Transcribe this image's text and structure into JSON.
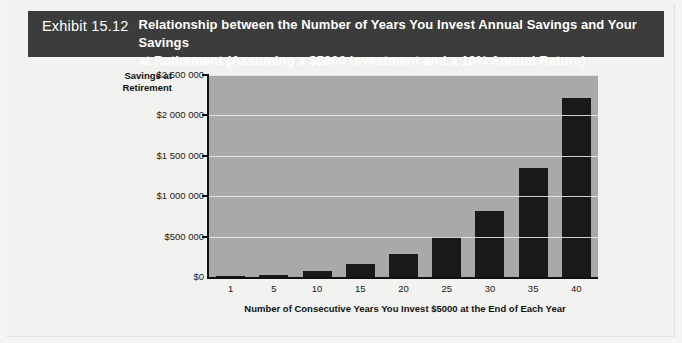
{
  "exhibit": {
    "label": "Exhibit 15.12",
    "title_line1": "Relationship between the Number of Years You Invest Annual Savings and Your Savings",
    "title_line2": "at Retirement (Assuming a $5000 Investment and a 10% Annual Return)"
  },
  "colors": {
    "banner_bg": "#3c3c3c",
    "banner_text": "#ffffff",
    "plot_bg": "#a9a9a9",
    "bar": "#191919",
    "gridline": "#efefef",
    "axis": "#111111",
    "page_bg": "#f2f2f0"
  },
  "chart_data": {
    "type": "bar",
    "title": "Relationship between the Number of Years You Invest Annual Savings and Your Savings at Retirement (Assuming a $5000 Investment and a 10% Annual Return)",
    "xlabel": "Number of Consecutive Years You Invest $5000 at the End of Each Year",
    "ylabel": "Savings at Retirement",
    "ylabel_line1": "Savings at",
    "ylabel_line2": "Retirement",
    "categories": [
      "1",
      "5",
      "10",
      "15",
      "20",
      "25",
      "30",
      "35",
      "40"
    ],
    "values": [
      5000,
      30000,
      80000,
      160000,
      286000,
      492000,
      822000,
      1355000,
      2212000
    ],
    "ytick_labels": [
      "$0",
      "$500 000",
      "$1 000 000",
      "$1 500 000",
      "$2 000 000",
      "$2 500 000"
    ],
    "ytick_values": [
      0,
      500000,
      1000000,
      1500000,
      2000000,
      2500000
    ],
    "ylim": [
      0,
      2500000
    ],
    "grid": true,
    "legend": "none"
  }
}
